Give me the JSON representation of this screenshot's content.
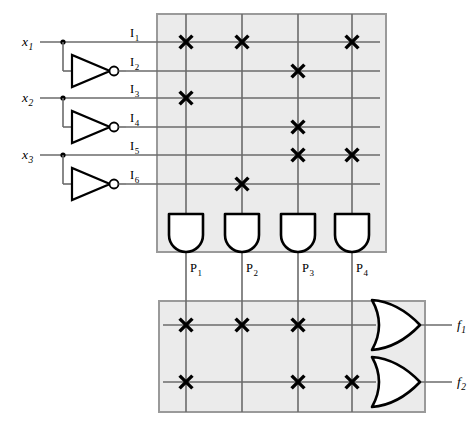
{
  "diagram": {
    "type": "logic-circuit"
  },
  "inputs": [
    {
      "id": "x1",
      "label": "x",
      "sub": "1",
      "y": 42
    },
    {
      "id": "x2",
      "label": "x",
      "sub": "2",
      "y": 98
    },
    {
      "id": "x3",
      "label": "x",
      "sub": "3",
      "y": 155
    }
  ],
  "input_lines": [
    {
      "id": "I1",
      "label": "I",
      "sub": "1",
      "y": 42,
      "source": "x1",
      "inverted": false
    },
    {
      "id": "I2",
      "label": "I",
      "sub": "2",
      "y": 71,
      "source": "x1",
      "inverted": true
    },
    {
      "id": "I3",
      "label": "I",
      "sub": "3",
      "y": 98,
      "source": "x2",
      "inverted": false
    },
    {
      "id": "I4",
      "label": "I",
      "sub": "4",
      "y": 127,
      "source": "x2",
      "inverted": true
    },
    {
      "id": "I5",
      "label": "I",
      "sub": "5",
      "y": 155,
      "source": "x3",
      "inverted": false
    },
    {
      "id": "I6",
      "label": "I",
      "sub": "6",
      "y": 184,
      "source": "x3",
      "inverted": true
    }
  ],
  "product_terms": [
    {
      "id": "P1",
      "label": "P",
      "sub": "1",
      "x": 186
    },
    {
      "id": "P2",
      "label": "P",
      "sub": "2",
      "x": 242
    },
    {
      "id": "P3",
      "label": "P",
      "sub": "3",
      "x": 298
    },
    {
      "id": "P4",
      "label": "P",
      "sub": "4",
      "x": 352
    }
  ],
  "outputs": [
    {
      "id": "f1",
      "label": "f",
      "sub": "1",
      "y": 325
    },
    {
      "id": "f2",
      "label": "f",
      "sub": "2",
      "y": 382
    }
  ],
  "and_plane": {
    "name": "AND plane",
    "box": {
      "x": 157,
      "y": 14,
      "w": 229,
      "h": 238
    },
    "connections": [
      {
        "row": "I1",
        "col": "P1"
      },
      {
        "row": "I1",
        "col": "P2"
      },
      {
        "row": "I1",
        "col": "P4"
      },
      {
        "row": "I2",
        "col": "P3"
      },
      {
        "row": "I3",
        "col": "P1"
      },
      {
        "row": "I4",
        "col": "P3"
      },
      {
        "row": "I5",
        "col": "P3"
      },
      {
        "row": "I5",
        "col": "P4"
      },
      {
        "row": "I6",
        "col": "P2"
      }
    ]
  },
  "or_plane": {
    "name": "OR plane",
    "box": {
      "x": 159,
      "y": 301,
      "w": 266,
      "h": 111
    },
    "connections": [
      {
        "row": "f1",
        "col": "P1"
      },
      {
        "row": "f1",
        "col": "P2"
      },
      {
        "row": "f1",
        "col": "P3"
      },
      {
        "row": "f2",
        "col": "P1"
      },
      {
        "row": "f2",
        "col": "P3"
      },
      {
        "row": "f2",
        "col": "P4"
      }
    ]
  },
  "colors": {
    "plane_fill": "#ebebeb",
    "plane_stroke": "#9a9a9a",
    "wire": "#6b6b6b",
    "gate_stroke": "#000000",
    "cross": "#000000",
    "background": "#ffffff"
  },
  "geometry": {
    "input_label_x": 22,
    "tap_x": 63,
    "inv_left": 72,
    "inv_right": 110,
    "inv_half_h": 16,
    "bubble_x": 114,
    "bubble_r": 4.5,
    "line_label_x": 130,
    "row_line_start": 126,
    "row_line_end": 380,
    "and_gate_top": 214,
    "and_gate_w": 34,
    "and_gate_h": 38,
    "p_label_y": 272,
    "col_line_top": 14,
    "col_line_bottom": 412,
    "or_gate_left": 372,
    "or_gate_right": 420,
    "or_gate_half_h": 25,
    "or_row_start": 163,
    "out_line_end": 452,
    "out_label_x": 457
  }
}
